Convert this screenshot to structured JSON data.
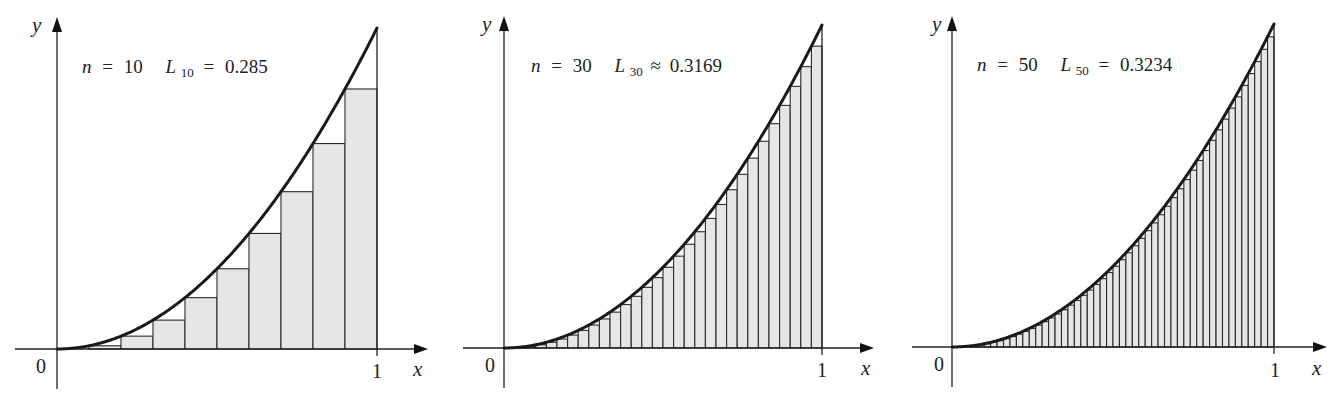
{
  "figure": {
    "function": "y = x^2",
    "background": "#ffffff",
    "rect_fill": "#e6e6e6",
    "stroke_color": "#222222"
  },
  "chart_data": [
    {
      "type": "area",
      "title": "n = 10   L10 = 0.285",
      "n": 10,
      "approx_name": "L",
      "approx_sub": "10",
      "relation": "=",
      "approx_value": "0.285",
      "function": "x^2",
      "xlabel": "x",
      "ylabel": "y",
      "x_ticks": [
        "0",
        "1"
      ],
      "xlim": [
        0,
        1
      ],
      "ylim": [
        0,
        1
      ],
      "rect_left_endpoints": [
        0,
        0.1,
        0.2,
        0.3,
        0.4,
        0.5,
        0.6,
        0.7,
        0.8,
        0.9
      ],
      "rect_heights": [
        0,
        0.01,
        0.04,
        0.09,
        0.16,
        0.25,
        0.36,
        0.49,
        0.64,
        0.81
      ],
      "geom": {
        "ox": 57,
        "oy": 349,
        "x1": 377,
        "ytop": 28,
        "axis_left": 15,
        "axis_right": 428,
        "yaxis_top": 18,
        "yaxis_bottom": 389
      }
    },
    {
      "type": "area",
      "title": "n = 30   L30 ≈ 0.3169",
      "n": 30,
      "approx_name": "L",
      "approx_sub": "30",
      "relation": "≈",
      "approx_value": "0.3169",
      "function": "x^2",
      "xlabel": "x",
      "ylabel": "y",
      "x_ticks": [
        "0",
        "1"
      ],
      "xlim": [
        0,
        1
      ],
      "ylim": [
        0,
        1
      ],
      "geom": {
        "ox": 504,
        "oy": 348,
        "x1": 822,
        "ytop": 25,
        "axis_left": 463,
        "axis_right": 874,
        "yaxis_top": 17,
        "yaxis_bottom": 388
      }
    },
    {
      "type": "area",
      "title": "n = 50   L50 = 0.3234",
      "n": 50,
      "approx_name": "L",
      "approx_sub": "50",
      "relation": "=",
      "approx_value": "0.3234",
      "function": "x^2",
      "xlabel": "x",
      "ylabel": "y",
      "x_ticks": [
        "0",
        "1"
      ],
      "xlim": [
        0,
        1
      ],
      "ylim": [
        0,
        1
      ],
      "geom": {
        "ox": 952,
        "oy": 347,
        "x1": 1274,
        "ytop": 24,
        "axis_left": 912,
        "axis_right": 1327,
        "yaxis_top": 17,
        "yaxis_bottom": 387
      }
    }
  ],
  "panels": [
    {
      "n_label": "n",
      "eq": "=",
      "n_value": "10",
      "L": "L",
      "L_sub": "10",
      "rel": "=",
      "L_value": "0.285",
      "zero": "0",
      "one": "1",
      "x": "x",
      "y": "y"
    },
    {
      "n_label": "n",
      "eq": "=",
      "n_value": "30",
      "L": "L",
      "L_sub": "30",
      "rel": "≈",
      "L_value": "0.3169",
      "zero": "0",
      "one": "1",
      "x": "x",
      "y": "y"
    },
    {
      "n_label": "n",
      "eq": "=",
      "n_value": "50",
      "L": "L",
      "L_sub": "50",
      "rel": "=",
      "L_value": "0.3234",
      "zero": "0",
      "one": "1",
      "x": "x",
      "y": "y"
    }
  ]
}
